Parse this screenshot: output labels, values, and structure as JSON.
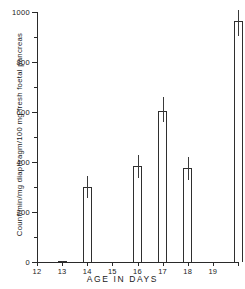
{
  "chart_data": {
    "type": "bar",
    "title": "",
    "xlabel": "AGE IN DAYS",
    "ylabel": "Count/min/mg diaphragm/100 mg fresh foetal pancreas",
    "categories": [
      "13",
      "14",
      "16",
      "17",
      "18",
      "20"
    ],
    "values": [
      5,
      300,
      385,
      605,
      378,
      965
    ],
    "errors_upper": [
      5,
      345,
      430,
      660,
      420,
      1010
    ],
    "errors_lower": [
      0,
      258,
      338,
      560,
      330,
      905
    ],
    "xlim": [
      12,
      20
    ],
    "ylim": [
      0,
      1000
    ],
    "x_ticks": [
      12,
      13,
      14,
      15,
      16,
      17,
      18,
      19,
      20
    ],
    "x_tick_labels": [
      "12",
      "13",
      "14",
      "15",
      "16",
      "17",
      "18",
      "19",
      ""
    ],
    "y_ticks_major": [
      0,
      200,
      400,
      600,
      800,
      1000
    ],
    "y_tick_labels": [
      "0",
      "200",
      "400",
      "600",
      "800",
      "1000"
    ],
    "y_ticks_minor": [
      100,
      300,
      500,
      700,
      900
    ],
    "grid": false,
    "legend": "none",
    "error_bar_style": "vertical-line-no-caps",
    "bar_fill": "#ffffff",
    "bar_stroke": "#2f2f2f",
    "axis_color": "#2a2a2a"
  }
}
